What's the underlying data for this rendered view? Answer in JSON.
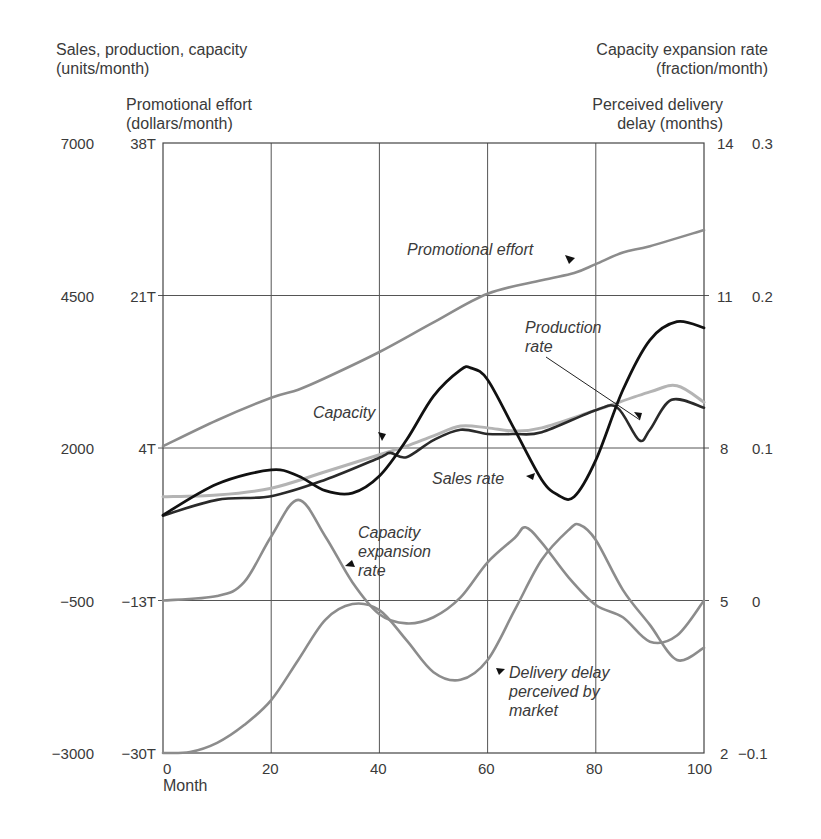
{
  "axes": {
    "left_outer_title": [
      "Sales, production, capacity",
      "(units/month)"
    ],
    "left_inner_title": [
      "Promotional effort",
      "(dollars/month)"
    ],
    "right_outer_title": [
      "Capacity expansion rate",
      "(fraction/month)"
    ],
    "right_inner_title": [
      "Perceived delivery",
      "delay (months)"
    ],
    "x_title": "Month",
    "x_ticks": [
      "0",
      "20",
      "40",
      "60",
      "80",
      "100"
    ],
    "left_outer_ticks": [
      "7000",
      "4500",
      "2000",
      "−500",
      "−3000"
    ],
    "left_inner_ticks": [
      "38T",
      "21T",
      "4T",
      "−13T",
      "−30T"
    ],
    "right_inner_ticks": [
      "14",
      "11",
      "8",
      "5",
      "2"
    ],
    "right_outer_ticks": [
      "0.3",
      "0.2",
      "0.1",
      "0",
      "−0.1"
    ]
  },
  "annotations": {
    "promotional_effort": "Promotional effort",
    "production_rate": [
      "Production",
      "rate"
    ],
    "capacity": "Capacity",
    "sales_rate": "Sales rate",
    "capacity_expansion_rate": [
      "Capacity",
      "expansion",
      "rate"
    ],
    "delivery_delay": [
      "Delivery delay",
      "perceived by",
      "market"
    ]
  },
  "colors": {
    "grid": "#555555",
    "frame": "#444444",
    "promotional_effort": "#8c8c8c",
    "capacity": "#b4b4b4",
    "production_rate": "#2a2a2a",
    "sales_rate": "#111111",
    "capacity_expansion_rate": "#8c8c8c",
    "delivery_delay": "#8c8c8c"
  },
  "chart_data": {
    "type": "line",
    "title": "",
    "xlabel": "Month",
    "xlim": [
      0,
      100
    ],
    "grid": true,
    "axes": {
      "units_per_month": {
        "label": "Sales, production, capacity (units/month)",
        "range": [
          -3000,
          7000
        ],
        "ticks": [
          7000,
          4500,
          2000,
          -500,
          -3000
        ],
        "side": "left-outer"
      },
      "dollars_per_month": {
        "label": "Promotional effort (dollars/month)",
        "range_thousands": [
          -30,
          38
        ],
        "ticks": [
          "38T",
          "21T",
          "4T",
          "-13T",
          "-30T"
        ],
        "side": "left-inner"
      },
      "delay_months": {
        "label": "Perceived delivery delay (months)",
        "range": [
          2,
          14
        ],
        "ticks": [
          14,
          11,
          8,
          5,
          2
        ],
        "side": "right-inner"
      },
      "fraction_per_month": {
        "label": "Capacity expansion rate (fraction/month)",
        "range": [
          -0.1,
          0.3
        ],
        "ticks": [
          0.3,
          0.2,
          0.1,
          0,
          -0.1
        ],
        "side": "right-outer"
      }
    },
    "series": [
      {
        "name": "Promotional effort",
        "axis": "dollars_per_month",
        "unit": "thousand dollars/month",
        "x": [
          0,
          10,
          20,
          25,
          30,
          40,
          50,
          60,
          70,
          76,
          80,
          85,
          90,
          100
        ],
        "values": [
          4.2,
          7.1,
          9.6,
          10.5,
          11.8,
          14.7,
          18.0,
          21.2,
          22.7,
          23.5,
          24.5,
          25.8,
          26.5,
          28.3
        ]
      },
      {
        "name": "Capacity",
        "axis": "units_per_month",
        "x": [
          0,
          10,
          20,
          30,
          40,
          45,
          50,
          55,
          60,
          65,
          70,
          80,
          90,
          95,
          100
        ],
        "values": [
          1200,
          1230,
          1340,
          1610,
          1890,
          2030,
          2200,
          2360,
          2330,
          2280,
          2330,
          2620,
          2920,
          3020,
          2750
        ]
      },
      {
        "name": "Production rate",
        "axis": "units_per_month",
        "x": [
          0,
          10,
          20,
          30,
          40,
          42,
          45,
          50,
          55,
          60,
          65,
          70,
          80,
          84,
          88,
          90,
          94,
          100
        ],
        "values": [
          890,
          1150,
          1210,
          1480,
          1840,
          1920,
          1850,
          2130,
          2300,
          2230,
          2230,
          2260,
          2620,
          2660,
          2130,
          2300,
          2790,
          2660
        ]
      },
      {
        "name": "Sales rate",
        "axis": "units_per_month",
        "x": [
          0,
          10,
          20,
          25,
          30,
          35,
          40,
          45,
          50,
          55,
          57,
          60,
          65,
          70,
          73,
          76,
          80,
          85,
          90,
          95,
          100
        ],
        "values": [
          900,
          1410,
          1640,
          1540,
          1300,
          1260,
          1540,
          2130,
          2850,
          3280,
          3310,
          3120,
          2300,
          1480,
          1230,
          1200,
          1800,
          2950,
          3770,
          4070,
          3970
        ]
      },
      {
        "name": "Capacity expansion rate",
        "axis": "fraction_per_month",
        "x": [
          0,
          10,
          15,
          20,
          25,
          30,
          35,
          40,
          45,
          50,
          55,
          60,
          65,
          67,
          70,
          75,
          80,
          85,
          90,
          95,
          100
        ],
        "values": [
          0.0,
          0.003,
          0.012,
          0.042,
          0.066,
          0.042,
          0.012,
          -0.009,
          -0.015,
          -0.011,
          0.002,
          0.025,
          0.041,
          0.048,
          0.038,
          0.015,
          -0.003,
          -0.011,
          -0.027,
          -0.023,
          0.0
        ]
      },
      {
        "name": "Delivery delay perceived by market",
        "axis": "delay_months",
        "x": [
          0,
          5,
          10,
          15,
          20,
          25,
          30,
          35,
          40,
          45,
          50,
          55,
          60,
          65,
          70,
          75,
          77,
          80,
          85,
          90,
          95,
          100
        ],
        "values": [
          2.0,
          2.02,
          2.2,
          2.55,
          3.04,
          3.83,
          4.62,
          4.93,
          4.81,
          4.22,
          3.59,
          3.44,
          3.83,
          4.81,
          5.8,
          6.39,
          6.49,
          6.19,
          5.21,
          4.52,
          3.83,
          4.07
        ]
      }
    ]
  }
}
